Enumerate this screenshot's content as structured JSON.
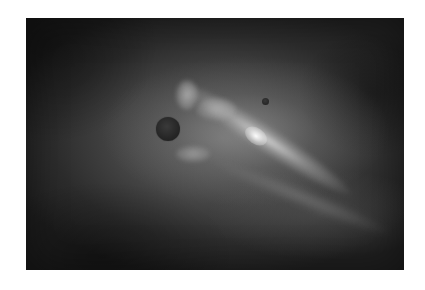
{
  "image": {
    "subject": "grayscale space scene: nebula with two dark planetary bodies",
    "colors": {
      "page_background": "#ffffff",
      "space_dark": "#1e1e1e",
      "nebula_mid": "#6a6a6a",
      "nebula_bright": "#e6e6e6",
      "planet": "#262626"
    },
    "bodies": [
      {
        "name": "large-planet",
        "cx": 168,
        "cy": 129,
        "r": 12
      },
      {
        "name": "small-moon",
        "cx": 265,
        "cy": 101,
        "r": 3.5
      }
    ]
  }
}
